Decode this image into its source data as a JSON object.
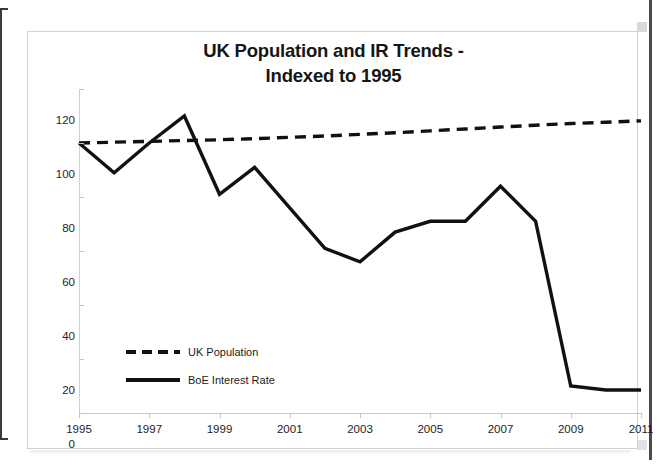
{
  "chart_data": {
    "type": "line",
    "title": "UK Population and IR Trends - Indexed to 1995",
    "title_line1": "UK Population and IR Trends -",
    "title_line2": "Indexed to 1995",
    "xlabel": "",
    "ylabel": "",
    "x": [
      1995,
      1996,
      1997,
      1998,
      1999,
      2000,
      2001,
      2002,
      2003,
      2004,
      2005,
      2006,
      2007,
      2008,
      2009,
      2010,
      2011
    ],
    "xlim": [
      1995,
      2011
    ],
    "ylim": [
      0,
      120
    ],
    "xticks": [
      "1995",
      "1997",
      "1999",
      "2001",
      "2003",
      "2005",
      "2007",
      "2009",
      "2011"
    ],
    "xtick_values": [
      1995,
      1997,
      1999,
      2001,
      2003,
      2005,
      2007,
      2009,
      2011
    ],
    "yticks": [
      "0",
      "20",
      "40",
      "60",
      "80",
      "100",
      "120"
    ],
    "ytick_values": [
      0,
      20,
      40,
      60,
      80,
      100,
      120
    ],
    "grid": false,
    "legend_position": "inside-lower-left",
    "series": [
      {
        "name": "UK Population",
        "style": "dashed",
        "color": "#111111",
        "values": [
          100,
          100.3,
          100.6,
          100.9,
          101.2,
          101.6,
          102.1,
          102.6,
          103.2,
          103.8,
          104.5,
          105.2,
          105.9,
          106.6,
          107.2,
          107.7,
          108.2
        ]
      },
      {
        "name": "BoE Interest Rate",
        "style": "solid",
        "color": "#111111",
        "values": [
          100,
          89,
          100,
          110,
          81,
          91,
          76,
          61,
          56,
          67,
          71,
          71,
          84,
          71,
          10,
          8.5,
          8.5
        ]
      }
    ]
  },
  "legend": {
    "items": [
      {
        "label": "UK Population",
        "style": "dashed"
      },
      {
        "label": "BoE Interest Rate",
        "style": "solid"
      }
    ]
  }
}
